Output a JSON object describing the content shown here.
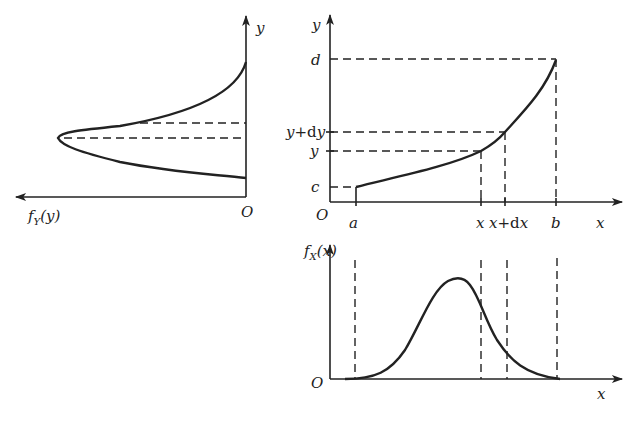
{
  "diagram": {
    "panels": {
      "left": {
        "title": "density of Y (rotated)",
        "axis_y_label": "y",
        "axis_h_label": "fY(y)",
        "axis_h_label_main": "f",
        "axis_h_label_sub": "Y",
        "axis_h_label_arg": "(y)",
        "origin_label": "O"
      },
      "top_right": {
        "title": "function y = g(x)",
        "axis_y_label": "y",
        "axis_x_label": "x",
        "origin_label": "O",
        "y_ticks": [
          "d",
          "y+dy",
          "y",
          "c"
        ],
        "y_tick_labels": {
          "d": "d",
          "ydy_main": "y",
          "ydy_plus": "+d",
          "ydy_tail": "y",
          "y": "y",
          "c": "c"
        },
        "x_ticks": [
          "a",
          "x",
          "x+dx",
          "b"
        ],
        "x_tick_labels": {
          "a": "a",
          "x": "x",
          "xdx_main": "x",
          "xdx_plus": "+d",
          "xdx_tail": "x",
          "b": "b"
        }
      },
      "bottom": {
        "title": "density of X",
        "axis_y_label": "fX(x)",
        "axis_y_label_main": "f",
        "axis_y_label_sub": "X",
        "axis_y_label_arg": "(x)",
        "axis_x_label": "x",
        "origin_label": "O"
      }
    },
    "colors": {
      "ink": "#222222",
      "background": "#ffffff"
    }
  }
}
